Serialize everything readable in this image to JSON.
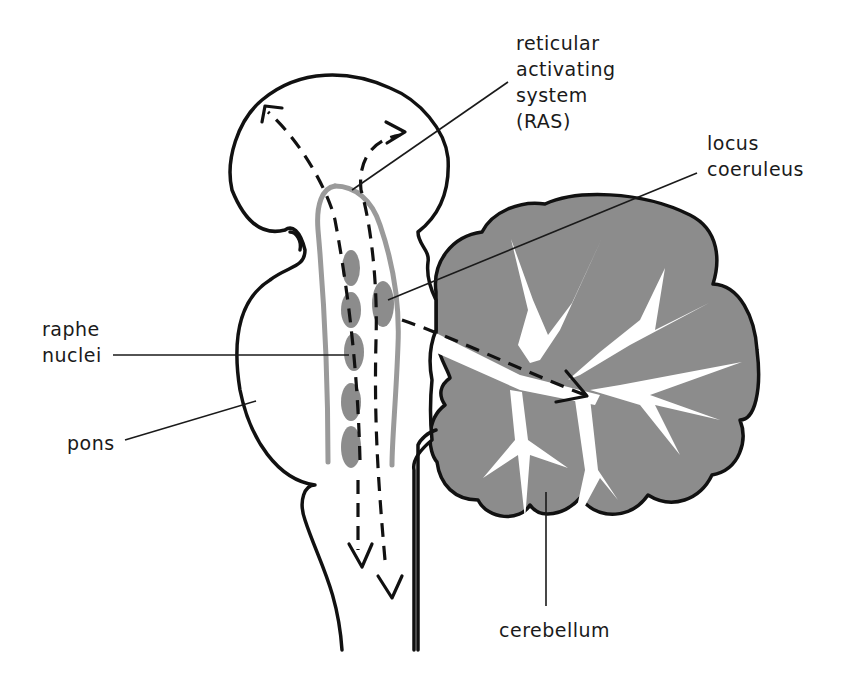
{
  "diagram": {
    "type": "anatomical brainstem diagram",
    "labels": {
      "ras": [
        "reticular",
        "activating",
        "system",
        "(RAS)"
      ],
      "locus": [
        "locus",
        "coeruleus"
      ],
      "raphe": [
        "raphe",
        "nuclei"
      ],
      "pons": "pons",
      "cerebellum": "cerebellum"
    },
    "colors": {
      "outline": "#111111",
      "gray_fill": "#8c8c8c",
      "ras_band": "#9a9a9a",
      "background": "#ffffff"
    },
    "structures": {
      "raphe_nuclei_count": 5,
      "locus_coeruleus_count": 1
    }
  }
}
